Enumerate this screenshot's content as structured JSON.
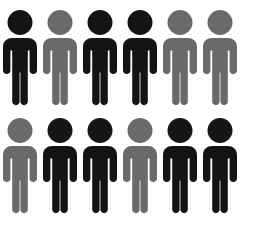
{
  "image": {
    "title": "People Pictogram Grid",
    "description": "Grid of twelve human pictogram icons arranged in two rows of six",
    "background_color": "#ffffff",
    "width": 258,
    "height": 228
  },
  "palette": {
    "dark": "#141414",
    "gray": "#6a6a6a",
    "background": "#ffffff"
  },
  "legend": {
    "dark_label": "dark",
    "gray_label": "gray"
  },
  "grid": {
    "rows": 2,
    "columns": 6,
    "total_figures": 12,
    "dark_count": 8,
    "gray_count": 4,
    "figure_label": "person-pictogram"
  },
  "rows": [
    {
      "index": 0,
      "figures": [
        {
          "index": 0,
          "color": "#141414",
          "tone": "dark"
        },
        {
          "index": 1,
          "color": "#6a6a6a",
          "tone": "gray"
        },
        {
          "index": 2,
          "color": "#141414",
          "tone": "dark"
        },
        {
          "index": 3,
          "color": "#141414",
          "tone": "dark"
        },
        {
          "index": 4,
          "color": "#6a6a6a",
          "tone": "gray"
        },
        {
          "index": 5,
          "color": "#6a6a6a",
          "tone": "gray"
        }
      ]
    },
    {
      "index": 1,
      "figures": [
        {
          "index": 0,
          "color": "#6a6a6a",
          "tone": "gray"
        },
        {
          "index": 1,
          "color": "#141414",
          "tone": "dark"
        },
        {
          "index": 2,
          "color": "#141414",
          "tone": "dark"
        },
        {
          "index": 3,
          "color": "#6a6a6a",
          "tone": "gray"
        },
        {
          "index": 4,
          "color": "#141414",
          "tone": "dark"
        },
        {
          "index": 5,
          "color": "#141414",
          "tone": "dark"
        }
      ]
    }
  ]
}
